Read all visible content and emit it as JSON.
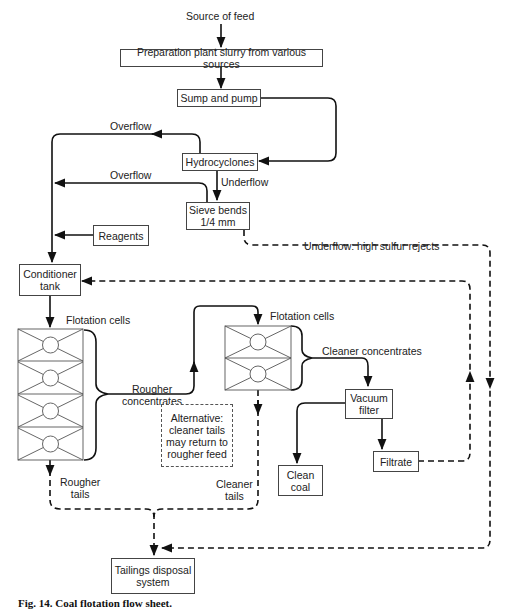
{
  "diagram": {
    "type": "process flow sheet",
    "nodes": {
      "source": "Source of feed",
      "preparation": "Preparation plant slurry from various sources",
      "sump": "Sump and pump",
      "hydrocyclones": "Hydrocyclones",
      "sieve": "Sieve bends\n1/4 mm",
      "reagents": "Reagents",
      "conditioner": "Conditioner\ntank",
      "rougher_cells_label": "Flotation cells",
      "cleaner_cells_label": "Flotation cells",
      "vacuum_filter": "Vacuum\nfilter",
      "filtrate": "Filtrate",
      "clean_coal": "Clean\ncoal",
      "alternative_note": "Alternative:\ncleaner tails\nmay return to\nrougher feed",
      "tailings": "Tailings disposal\nsystem"
    },
    "edge_labels": {
      "overflow_1": "Overflow",
      "overflow_2": "Overflow",
      "underflow": "Underflow",
      "underflow_rejects": "Underflow: high sulfur rejects",
      "rougher_concentrates": "Rougher\nconcentrates",
      "cleaner_concentrates": "Cleaner concentrates",
      "rougher_tails": "Rougher\ntails",
      "cleaner_tails": "Cleaner\ntails"
    },
    "edges": [
      {
        "from": "Source of feed",
        "to": "Preparation plant slurry from various sources",
        "style": "solid"
      },
      {
        "from": "Preparation plant slurry from various sources",
        "to": "Sump and pump",
        "style": "solid"
      },
      {
        "from": "Sump and pump",
        "to": "Hydrocyclones",
        "style": "solid"
      },
      {
        "from": "Hydrocyclones",
        "to": "Conditioner tank",
        "label": "Overflow",
        "style": "solid"
      },
      {
        "from": "Hydrocyclones",
        "to": "Sieve bends 1/4 mm",
        "label": "Underflow",
        "style": "solid"
      },
      {
        "from": "Sieve bends 1/4 mm",
        "to": "Conditioner tank",
        "label": "Overflow",
        "style": "solid"
      },
      {
        "from": "Reagents",
        "to": "Conditioner tank",
        "style": "solid"
      },
      {
        "from": "Sieve bends 1/4 mm",
        "to": "Tailings disposal system",
        "label": "Underflow: high sulfur rejects",
        "style": "dashed"
      },
      {
        "from": "Conditioner tank",
        "to": "Rougher flotation cells",
        "style": "solid"
      },
      {
        "from": "Rougher flotation cells",
        "to": "Cleaner flotation cells",
        "label": "Rougher concentrates",
        "style": "solid"
      },
      {
        "from": "Cleaner flotation cells",
        "to": "Vacuum filter",
        "label": "Cleaner concentrates",
        "style": "solid"
      },
      {
        "from": "Vacuum filter",
        "to": "Clean coal",
        "style": "solid"
      },
      {
        "from": "Vacuum filter",
        "to": "Filtrate",
        "style": "solid"
      },
      {
        "from": "Filtrate",
        "to": "Conditioner tank",
        "style": "dashed"
      },
      {
        "from": "Rougher flotation cells",
        "to": "Tailings disposal system",
        "label": "Rougher tails",
        "style": "dashed"
      },
      {
        "from": "Cleaner flotation cells",
        "to": "Tailings disposal system",
        "label": "Cleaner tails",
        "style": "dashed"
      }
    ],
    "rougher_cell_count": 4,
    "cleaner_cell_count": 2
  },
  "caption": "Fig. 14.  Coal flotation flow sheet."
}
